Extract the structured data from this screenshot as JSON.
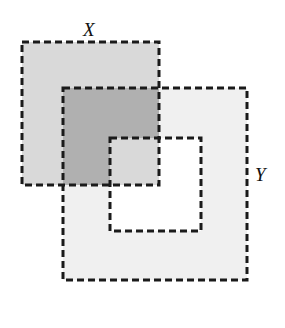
{
  "figure": {
    "title": "",
    "width": 285,
    "height": 328,
    "background": "#ffffff",
    "labels": {
      "x": "X",
      "y": "Y"
    },
    "colors": {
      "background": "#ffffff",
      "region_x_only": "#d9d9d9",
      "region_y_only": "#f0f0f0",
      "region_intersection": "#b0b0b0",
      "hole": "#ffffff",
      "stroke": "#1a1a1a"
    },
    "stroke": {
      "width": 3,
      "dash": "7 4",
      "color": "#1a1a1a"
    },
    "shapes": {
      "x_rect": {
        "x": 22,
        "y": 42,
        "width": 137,
        "height": 143
      },
      "y_outer_rect": {
        "x": 63,
        "y": 88,
        "width": 184,
        "height": 192
      },
      "y_hole_rect": {
        "x": 110,
        "y": 138,
        "width": 91,
        "height": 93
      }
    },
    "label_positions": {
      "x": {
        "left": 83,
        "top": 20
      },
      "y": {
        "left": 255,
        "top": 165
      }
    }
  },
  "chart_data": {
    "type": "diagram",
    "sets": [
      {
        "name": "X",
        "shape": "rectangle",
        "bounds": {
          "x": 22,
          "y": 42,
          "width": 137,
          "height": 143
        },
        "fill": "#d9d9d9",
        "label": "X"
      },
      {
        "name": "Y",
        "shape": "rectangular-annulus",
        "outer_bounds": {
          "x": 63,
          "y": 88,
          "width": 184,
          "height": 192
        },
        "hole_bounds": {
          "x": 110,
          "y": 138,
          "width": 91,
          "height": 93
        },
        "fill": "#f0f0f0",
        "label": "Y"
      }
    ],
    "regions": [
      {
        "name": "X only",
        "fill": "#d9d9d9"
      },
      {
        "name": "Y only",
        "fill": "#f0f0f0"
      },
      {
        "name": "X intersect Y",
        "fill": "#b0b0b0"
      },
      {
        "name": "hole in Y (excluded)",
        "fill": "#ffffff"
      }
    ],
    "legend": [],
    "xlabel": "",
    "ylabel": ""
  }
}
